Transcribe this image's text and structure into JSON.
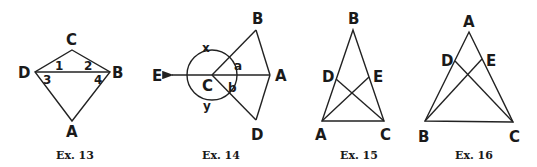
{
  "figures": [
    {
      "caption": "Ex. 13",
      "labels": {
        "C": "C",
        "D": "D",
        "B": "B",
        "A": "A"
      },
      "angles": {
        "a1": "1",
        "a2": "2",
        "a3": "3",
        "a4": "4"
      }
    },
    {
      "caption": "Ex. 14",
      "labels": {
        "B": "B",
        "E": "E",
        "C": "C",
        "A": "A",
        "D": "D"
      },
      "angles": {
        "x": "x",
        "y": "y",
        "a": "a",
        "b": "b"
      }
    },
    {
      "caption": "Ex. 15",
      "labels": {
        "B": "B",
        "D": "D",
        "E": "E",
        "A": "A",
        "C": "C"
      }
    },
    {
      "caption": "Ex. 16",
      "labels": {
        "A": "A",
        "D": "D",
        "E": "E",
        "B": "B",
        "C": "C"
      }
    }
  ]
}
